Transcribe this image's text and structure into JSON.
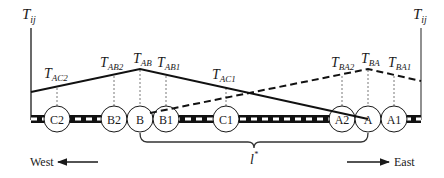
{
  "diagram": {
    "axis_label_left": "T",
    "axis_label_left_sub": "ij",
    "axis_label_right": "T",
    "axis_label_right_sub": "ij",
    "nodes": [
      {
        "id": "C2",
        "label": "C2",
        "x": 57
      },
      {
        "id": "B2",
        "label": "B2",
        "x": 114
      },
      {
        "id": "B",
        "label": "B",
        "x": 140
      },
      {
        "id": "B1",
        "label": "B1",
        "x": 166
      },
      {
        "id": "C1",
        "label": "C1",
        "x": 226
      },
      {
        "id": "A2",
        "label": "A2",
        "x": 342
      },
      {
        "id": "A",
        "label": "A",
        "x": 368
      },
      {
        "id": "A1",
        "label": "A1",
        "x": 394
      }
    ],
    "labels": {
      "T_AC2": {
        "main": "T",
        "sub": "AC2"
      },
      "T_AB2": {
        "main": "T",
        "sub": "AB2"
      },
      "T_AB": {
        "main": "T",
        "sub": "AB"
      },
      "T_AB1": {
        "main": "T",
        "sub": "AB1"
      },
      "T_AC1": {
        "main": "T",
        "sub": "AC1"
      },
      "T_BA2": {
        "main": "T",
        "sub": "BA2"
      },
      "T_BA": {
        "main": "T",
        "sub": "BA"
      },
      "T_BA1": {
        "main": "T",
        "sub": "BA1"
      }
    },
    "distance_label": "l",
    "distance_label_sup": "*",
    "west_label": "West",
    "east_label": "East",
    "colors": {
      "line": "#1a1a1a",
      "guide": "#555555",
      "background": "#ffffff"
    }
  }
}
